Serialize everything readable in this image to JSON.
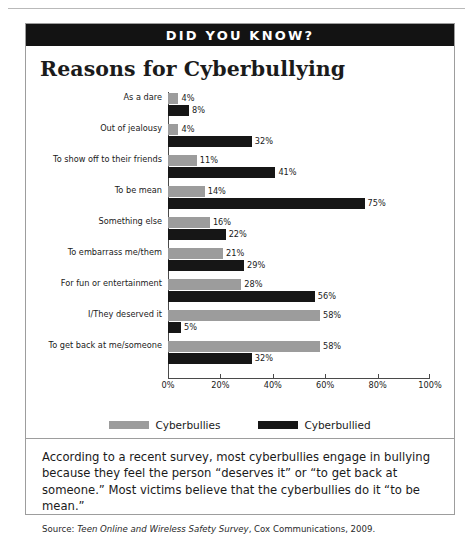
{
  "banner": {
    "title": "DID YOU KNOW?"
  },
  "chart_data": {
    "type": "bar",
    "orientation": "horizontal",
    "title": "Reasons for Cyberbullying",
    "xlabel": "",
    "ylabel": "",
    "xlim": [
      0,
      100
    ],
    "grid": false,
    "legend_position": "bottom",
    "tick_labels": [
      "0%",
      "20%",
      "40%",
      "60%",
      "80%",
      "100%"
    ],
    "ticks": [
      0,
      20,
      40,
      60,
      80,
      100
    ],
    "categories": [
      "As a dare",
      "Out of jealousy",
      "To show off to their friends",
      "To be mean",
      "Something else",
      "To embarrass me/them",
      "For fun or entertainment",
      "I/They deserved it",
      "To get back at me/someone"
    ],
    "series": [
      {
        "name": "Cyberbullies",
        "color": "#9c9c9c",
        "values": [
          4,
          4,
          11,
          14,
          16,
          21,
          28,
          58,
          58
        ],
        "labels": [
          "4%",
          "4%",
          "11%",
          "14%",
          "16%",
          "21%",
          "28%",
          "58%",
          "58%"
        ]
      },
      {
        "name": "Cyberbullied",
        "color": "#161616",
        "values": [
          8,
          32,
          41,
          75,
          22,
          29,
          56,
          5,
          32
        ],
        "labels": [
          "8%",
          "32%",
          "41%",
          "75%",
          "22%",
          "29%",
          "56%",
          "5%",
          "32%"
        ]
      }
    ]
  },
  "footer": {
    "text": "According to a recent survey, most cyberbullies engage in bullying because they feel the person “deserves it” or “to get back at someone.” Most victims believe that the cyberbullies do it “to be mean.”",
    "source_prefix": "Source: ",
    "source_title": "Teen Online and Wireless Safety Survey",
    "source_rest": ", Cox Communications, 2009."
  }
}
